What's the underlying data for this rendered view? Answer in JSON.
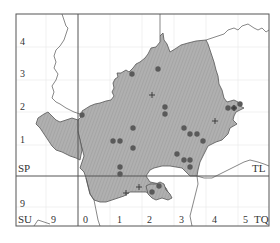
{
  "map": {
    "type": "distribution-map",
    "colors": {
      "region_fill": "#a9a9a9",
      "region_stroke": "#555555",
      "frame": "#555555",
      "gridline": "#e6e6e6",
      "dot": "#5a5a5a",
      "border_line": "#555555",
      "label": "#333333"
    },
    "square_labels": [
      {
        "text": "SP",
        "x": 18,
        "y": 172
      },
      {
        "text": "TL",
        "x": 252,
        "y": 172
      },
      {
        "text": "SU",
        "x": 18,
        "y": 223
      },
      {
        "text": "TQ",
        "x": 254,
        "y": 223
      }
    ],
    "y_ticks": [
      {
        "text": "4",
        "x": 20,
        "y": 45
      },
      {
        "text": "3",
        "x": 20,
        "y": 77
      },
      {
        "text": "2",
        "x": 20,
        "y": 110
      },
      {
        "text": "1",
        "x": 20,
        "y": 143
      },
      {
        "text": "9",
        "x": 20,
        "y": 207
      }
    ],
    "x_ticks": [
      {
        "text": "9",
        "x": 51,
        "y": 223
      },
      {
        "text": "0",
        "x": 83,
        "y": 223
      },
      {
        "text": "1",
        "x": 117,
        "y": 223
      },
      {
        "text": "2",
        "x": 147,
        "y": 223
      },
      {
        "text": "3",
        "x": 179,
        "y": 223
      },
      {
        "text": "4",
        "x": 212,
        "y": 223
      },
      {
        "text": "5",
        "x": 243,
        "y": 223
      }
    ],
    "records_dots": [
      {
        "x": 132,
        "y": 74
      },
      {
        "x": 158,
        "y": 69
      },
      {
        "x": 82,
        "y": 115
      },
      {
        "x": 165,
        "y": 107
      },
      {
        "x": 165,
        "y": 114
      },
      {
        "x": 228,
        "y": 108
      },
      {
        "x": 234,
        "y": 108
      },
      {
        "x": 240,
        "y": 104
      },
      {
        "x": 133,
        "y": 128
      },
      {
        "x": 184,
        "y": 128
      },
      {
        "x": 113,
        "y": 141
      },
      {
        "x": 120,
        "y": 141
      },
      {
        "x": 190,
        "y": 134
      },
      {
        "x": 197,
        "y": 134
      },
      {
        "x": 203,
        "y": 141
      },
      {
        "x": 133,
        "y": 148
      },
      {
        "x": 177,
        "y": 154
      },
      {
        "x": 184,
        "y": 160
      },
      {
        "x": 190,
        "y": 160
      },
      {
        "x": 190,
        "y": 167
      },
      {
        "x": 120,
        "y": 167
      },
      {
        "x": 120,
        "y": 174
      },
      {
        "x": 159,
        "y": 186
      },
      {
        "x": 152,
        "y": 192
      }
    ],
    "records_plus": [
      {
        "x": 152,
        "y": 95
      },
      {
        "x": 234,
        "y": 108
      },
      {
        "x": 215,
        "y": 121
      },
      {
        "x": 139,
        "y": 187
      },
      {
        "x": 126,
        "y": 193
      }
    ]
  }
}
